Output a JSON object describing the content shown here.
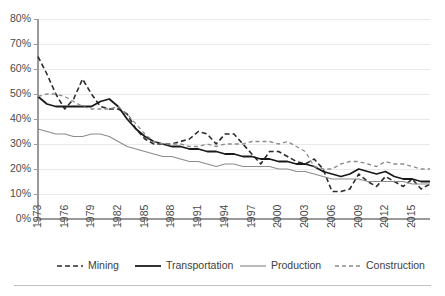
{
  "chart_data": {
    "type": "line",
    "title": "",
    "subtitle": "",
    "xlabel": "",
    "ylabel": "",
    "grid": "horizontal",
    "legend_position": "bottom",
    "xlim": [
      1973,
      2017
    ],
    "ylim": [
      0,
      80
    ],
    "ytick_step": 10,
    "ytick_labels": [
      "0%",
      "10%",
      "20%",
      "30%",
      "40%",
      "50%",
      "60%",
      "70%",
      "80%"
    ],
    "ytick_values": [
      0,
      10,
      20,
      30,
      40,
      50,
      60,
      70,
      80
    ],
    "xtick_labels": [
      "1973",
      "1976",
      "1979",
      "1982",
      "1985",
      "1988",
      "1991",
      "1994",
      "1997",
      "2000",
      "2003",
      "2006",
      "2009",
      "2012",
      "2015"
    ],
    "xtick_values": [
      1973,
      1976,
      1979,
      1982,
      1985,
      1988,
      1991,
      1994,
      1997,
      2000,
      2003,
      2006,
      2009,
      2012,
      2015
    ],
    "x": [
      1973,
      1974,
      1975,
      1976,
      1977,
      1978,
      1979,
      1980,
      1981,
      1982,
      1983,
      1984,
      1985,
      1986,
      1987,
      1988,
      1989,
      1990,
      1991,
      1992,
      1993,
      1994,
      1995,
      1996,
      1997,
      1998,
      1999,
      2000,
      2001,
      2002,
      2003,
      2004,
      2005,
      2006,
      2007,
      2008,
      2009,
      2010,
      2011,
      2012,
      2013,
      2014,
      2015,
      2016,
      2017
    ],
    "series": [
      {
        "name": "Mining",
        "style": "dashed",
        "color": "#2b2b2b",
        "width": 1.6,
        "dasharray": "5,3",
        "values": [
          65,
          58,
          50,
          44,
          48,
          56,
          50,
          45,
          44,
          44,
          42,
          36,
          32,
          30,
          30,
          30,
          31,
          32,
          35,
          34,
          30,
          34,
          34,
          30,
          26,
          22,
          27,
          27,
          25,
          23,
          22,
          24,
          20,
          11,
          11,
          12,
          18,
          15,
          13,
          17,
          15,
          13,
          16,
          12,
          14
        ]
      },
      {
        "name": "Transportation",
        "style": "solid",
        "color": "#1a1a1a",
        "width": 1.8,
        "dasharray": "",
        "values": [
          49,
          46,
          45,
          45,
          45,
          45,
          45,
          47,
          48,
          45,
          40,
          36,
          33,
          31,
          30,
          29,
          29,
          28,
          28,
          27,
          27,
          26,
          26,
          25,
          25,
          24,
          24,
          23,
          23,
          22,
          22,
          21,
          19,
          18,
          17,
          18,
          20,
          19,
          18,
          19,
          17,
          16,
          16,
          15,
          15
        ]
      },
      {
        "name": "Production",
        "style": "solid",
        "color": "#8c8c8c",
        "width": 1.2,
        "dasharray": "",
        "values": [
          36,
          35,
          34,
          34,
          33,
          33,
          34,
          34,
          33,
          31,
          29,
          28,
          27,
          26,
          25,
          25,
          24,
          23,
          23,
          22,
          21,
          22,
          22,
          21,
          21,
          21,
          21,
          20,
          20,
          19,
          19,
          18,
          17,
          16,
          16,
          16,
          16,
          15,
          15,
          15,
          15,
          15,
          14,
          14,
          14
        ]
      },
      {
        "name": "Construction",
        "style": "dashed",
        "color": "#8c8c8c",
        "width": 1.3,
        "dasharray": "4,3",
        "values": [
          49,
          50,
          50,
          49,
          47,
          45,
          44,
          44,
          44,
          45,
          42,
          38,
          34,
          31,
          30,
          30,
          30,
          29,
          29,
          30,
          29,
          30,
          30,
          30,
          31,
          31,
          31,
          30,
          31,
          29,
          27,
          21,
          20,
          20,
          22,
          23,
          23,
          22,
          21,
          23,
          22,
          22,
          21,
          20,
          20
        ]
      }
    ]
  },
  "legend": {
    "items": [
      {
        "label": "Mining"
      },
      {
        "label": "Transportation"
      },
      {
        "label": "Production"
      },
      {
        "label": "Construction"
      }
    ]
  }
}
